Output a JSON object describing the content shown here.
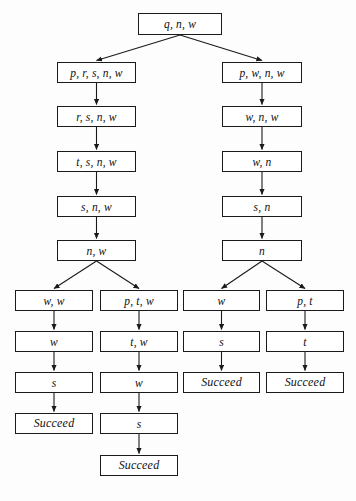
{
  "diagram": {
    "type": "search-tree",
    "title": "",
    "terminal_label": "Succeed",
    "nodes": [
      {
        "id": "root",
        "label": "q, n, w",
        "x": 138,
        "y": 13,
        "w": 84,
        "h": 22
      },
      {
        "id": "l1",
        "label": "p, r, s, n, w",
        "x": 57,
        "y": 62,
        "w": 79,
        "h": 21
      },
      {
        "id": "l2",
        "label": "r, s, n, w",
        "x": 57,
        "y": 106,
        "w": 79,
        "h": 21
      },
      {
        "id": "l3",
        "label": "t, s, n, w",
        "x": 57,
        "y": 151,
        "w": 79,
        "h": 21
      },
      {
        "id": "l4",
        "label": "s, n, w",
        "x": 57,
        "y": 196,
        "w": 79,
        "h": 21
      },
      {
        "id": "l5",
        "label": "n, w",
        "x": 57,
        "y": 240,
        "w": 79,
        "h": 21
      },
      {
        "id": "r1",
        "label": "p, w, n, w",
        "x": 222,
        "y": 62,
        "w": 80,
        "h": 21
      },
      {
        "id": "r2",
        "label": "w, n, w",
        "x": 222,
        "y": 106,
        "w": 80,
        "h": 21
      },
      {
        "id": "r3",
        "label": "w, n",
        "x": 222,
        "y": 151,
        "w": 80,
        "h": 21
      },
      {
        "id": "r4",
        "label": "s, n",
        "x": 222,
        "y": 196,
        "w": 80,
        "h": 21
      },
      {
        "id": "r5",
        "label": "n",
        "x": 222,
        "y": 240,
        "w": 80,
        "h": 21
      },
      {
        "id": "c1a",
        "label": "w, w",
        "x": 15,
        "y": 290,
        "w": 78,
        "h": 21
      },
      {
        "id": "c1b",
        "label": "w",
        "x": 15,
        "y": 331,
        "w": 78,
        "h": 21
      },
      {
        "id": "c1c",
        "label": "s",
        "x": 15,
        "y": 372,
        "w": 78,
        "h": 21
      },
      {
        "id": "c1d",
        "label": "Succeed",
        "x": 15,
        "y": 413,
        "w": 78,
        "h": 21,
        "terminal": true
      },
      {
        "id": "c2a",
        "label": "p, t, w",
        "x": 100,
        "y": 290,
        "w": 78,
        "h": 21
      },
      {
        "id": "c2b",
        "label": "t, w",
        "x": 100,
        "y": 331,
        "w": 78,
        "h": 21
      },
      {
        "id": "c2c",
        "label": "w",
        "x": 100,
        "y": 372,
        "w": 78,
        "h": 21
      },
      {
        "id": "c2d",
        "label": "s",
        "x": 100,
        "y": 413,
        "w": 78,
        "h": 21
      },
      {
        "id": "c2e",
        "label": "Succeed",
        "x": 100,
        "y": 455,
        "w": 78,
        "h": 21,
        "terminal": true
      },
      {
        "id": "c3a",
        "label": "w",
        "x": 183,
        "y": 290,
        "w": 77,
        "h": 21
      },
      {
        "id": "c3b",
        "label": "s",
        "x": 183,
        "y": 331,
        "w": 77,
        "h": 21
      },
      {
        "id": "c3c",
        "label": "Succeed",
        "x": 183,
        "y": 372,
        "w": 77,
        "h": 21,
        "terminal": true
      },
      {
        "id": "c4a",
        "label": "p, t",
        "x": 266,
        "y": 290,
        "w": 78,
        "h": 21
      },
      {
        "id": "c4b",
        "label": "t",
        "x": 266,
        "y": 331,
        "w": 78,
        "h": 21
      },
      {
        "id": "c4c",
        "label": "Succeed",
        "x": 266,
        "y": 372,
        "w": 78,
        "h": 21,
        "terminal": true
      }
    ],
    "edges": [
      {
        "from": "root",
        "to": "l1"
      },
      {
        "from": "root",
        "to": "r1"
      },
      {
        "from": "l1",
        "to": "l2"
      },
      {
        "from": "l2",
        "to": "l3"
      },
      {
        "from": "l3",
        "to": "l4"
      },
      {
        "from": "l4",
        "to": "l5"
      },
      {
        "from": "r1",
        "to": "r2"
      },
      {
        "from": "r2",
        "to": "r3"
      },
      {
        "from": "r3",
        "to": "r4"
      },
      {
        "from": "r4",
        "to": "r5"
      },
      {
        "from": "l5",
        "to": "c1a"
      },
      {
        "from": "l5",
        "to": "c2a"
      },
      {
        "from": "c1a",
        "to": "c1b"
      },
      {
        "from": "c1b",
        "to": "c1c"
      },
      {
        "from": "c1c",
        "to": "c1d"
      },
      {
        "from": "c2a",
        "to": "c2b"
      },
      {
        "from": "c2b",
        "to": "c2c"
      },
      {
        "from": "c2c",
        "to": "c2d"
      },
      {
        "from": "c2d",
        "to": "c2e"
      },
      {
        "from": "r5",
        "to": "c3a"
      },
      {
        "from": "r5",
        "to": "c4a"
      },
      {
        "from": "c3a",
        "to": "c3b"
      },
      {
        "from": "c3b",
        "to": "c3c"
      },
      {
        "from": "c4a",
        "to": "c4b"
      },
      {
        "from": "c4b",
        "to": "c4c"
      }
    ],
    "colors": {
      "background": "#fdfdfd",
      "node_fill": "#ffffff",
      "node_border": "#1a1a1a",
      "edge": "#1a1a1a",
      "text": "#101010"
    }
  }
}
